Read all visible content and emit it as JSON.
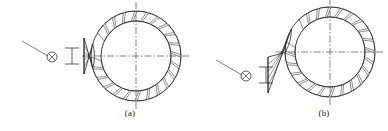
{
  "sheet": {
    "background_color": "#ffffff",
    "line_color": "#1a1a1a",
    "width": 388,
    "height": 131
  },
  "figures": [
    {
      "id": "a",
      "caption": "(a)",
      "description": "nozzle-ring-assembly-variant-a",
      "center_x": 136,
      "center_y": 56,
      "outer_radius": 45,
      "inner_radius": 35,
      "segment_count": 24,
      "nozzle": {
        "name": "wedge-nozzle-inlet",
        "attach_angle_deg": 180,
        "outer_x": 84,
        "top_y": 38,
        "bottom_y": 74
      },
      "centerline": {
        "style": "dash-dot",
        "horizontal_y": 56,
        "vertical_x": 136,
        "overhang": 9
      },
      "leader": {
        "name": "leader-line",
        "x1": 22,
        "y1": 41,
        "x2": 48,
        "y2": 56
      },
      "target_symbol": {
        "name": "circled-cross-symbol",
        "cx": 52,
        "cy": 57,
        "r": 5
      },
      "section_mark": {
        "name": "section-i-beam-mark",
        "x": 65,
        "y": 48,
        "width": 14,
        "height": 16
      }
    },
    {
      "id": "b",
      "caption": "(b)",
      "description": "nozzle-ring-assembly-variant-b",
      "center_x": 330,
      "center_y": 52,
      "outer_radius": 45,
      "inner_radius": 35,
      "segment_count": 24,
      "nozzle": {
        "name": "wedge-nozzle-inlet",
        "attach_angle_deg": 195,
        "outer_x": 268,
        "top_y": 57,
        "bottom_y": 93
      },
      "centerline": {
        "style": "dash-dot",
        "horizontal_y": 52,
        "vertical_x": 330,
        "overhang": 9
      },
      "leader": {
        "name": "leader-line",
        "x1": 216,
        "y1": 60,
        "x2": 242,
        "y2": 75
      },
      "target_symbol": {
        "name": "circled-cross-symbol",
        "cx": 246,
        "cy": 76,
        "r": 5
      },
      "section_mark": {
        "name": "section-i-beam-mark",
        "x": 259,
        "y": 67,
        "width": 14,
        "height": 16
      }
    }
  ]
}
